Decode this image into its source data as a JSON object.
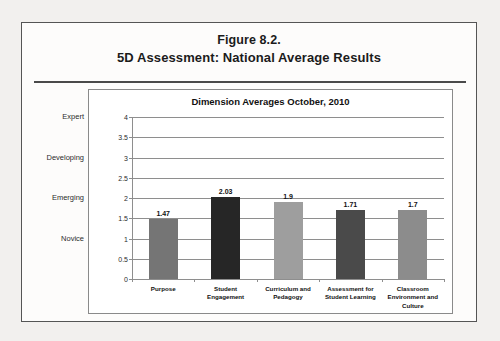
{
  "figure": {
    "title_line1": "Figure 8.2.",
    "title_line2": "5D Assessment: National Average Results"
  },
  "band_labels": [
    {
      "label": "Expert",
      "value": 4
    },
    {
      "label": "Developing",
      "value": 3
    },
    {
      "label": "Emerging",
      "value": 2
    },
    {
      "label": "Novice",
      "value": 1
    }
  ],
  "chart_data": {
    "type": "bar",
    "title": "Dimension Averages October, 2010",
    "xlabel": "",
    "ylabel": "",
    "ylim": [
      0,
      4
    ],
    "yticks": [
      "0",
      "0.5",
      "1",
      "1.5",
      "2",
      "2.5",
      "3",
      "3.5",
      "4"
    ],
    "grid": true,
    "legend": "none",
    "categories": [
      "Purpose",
      "Student Engagement",
      "Curriculum and Pedagogy",
      "Assessment for Student Learning",
      "Classroom Environment and Culture"
    ],
    "values": [
      1.47,
      2.03,
      1.9,
      1.71,
      1.7
    ],
    "data_labels": [
      "1.47",
      "2.03",
      "1.9",
      "1.71",
      "1.7"
    ],
    "bar_colors": [
      "#757575",
      "#262626",
      "#9e9e9e",
      "#4a4a4a",
      "#8c8c8c"
    ]
  },
  "colors": {
    "page_background": "#fdfcfb",
    "canvas_background": "#f2f0ee",
    "border": "#555555",
    "gridline": "#8e8e8e",
    "text": "#1b1b1b"
  }
}
